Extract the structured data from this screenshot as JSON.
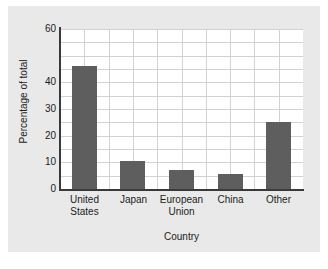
{
  "chart_data": {
    "type": "bar",
    "title": "",
    "xlabel": "Country",
    "ylabel": "Percentage of total",
    "categories": [
      "United States",
      "Japan",
      "European Union",
      "China",
      "Other"
    ],
    "category_lines": [
      [
        "United",
        "States"
      ],
      [
        "Japan"
      ],
      [
        "European",
        "Union"
      ],
      [
        "China"
      ],
      [
        "Other"
      ]
    ],
    "values": [
      46,
      10.5,
      7,
      5.5,
      25
    ],
    "ylim": [
      0,
      60
    ],
    "y_tick_labels": [
      "60",
      "40",
      "30",
      "20",
      "10",
      "0"
    ],
    "y_tick_values": [
      60,
      40,
      30,
      20,
      10,
      0
    ],
    "gridline_interval": 5,
    "grid": "on",
    "legend": "none",
    "bar_color": "#5e5e5e",
    "plot_background": "#ffffff",
    "figure_background": "#e9e9e9",
    "gridline_color": "#d2d2d2",
    "axis_color": "#3a3a3a"
  },
  "caption": ""
}
